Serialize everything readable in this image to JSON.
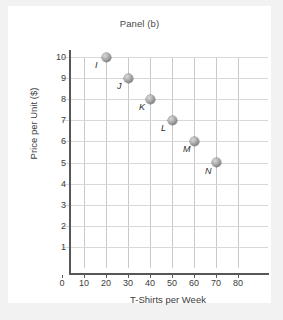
{
  "figure": {
    "title": "Panel (b)"
  },
  "chart_data": {
    "type": "scatter",
    "title": "Panel (b)",
    "xlabel": "T-Shirts per Week",
    "ylabel": "Price per Unit ($)",
    "xlim": [
      0,
      80
    ],
    "ylim": [
      0,
      10
    ],
    "xticks": [
      "0",
      "10",
      "20",
      "30",
      "40",
      "50",
      "60",
      "70",
      "80"
    ],
    "yticks": [
      "1",
      "2",
      "3",
      "4",
      "5",
      "6",
      "7",
      "8",
      "9",
      "10"
    ],
    "grid": true,
    "legend": "none",
    "marker_style": "gray-sphere",
    "points": [
      {
        "label": "I",
        "x": 20,
        "y": 10
      },
      {
        "label": "J",
        "x": 30,
        "y": 9
      },
      {
        "label": "K",
        "x": 40,
        "y": 8
      },
      {
        "label": "L",
        "x": 50,
        "y": 7
      },
      {
        "label": "M",
        "x": 60,
        "y": 6
      },
      {
        "label": "N",
        "x": 70,
        "y": 5
      }
    ]
  },
  "colors": {
    "page_background": "#f2f2f2",
    "card_background": "#ffffff",
    "axis": "#585858",
    "gridline_vertical": "#c9c9c9",
    "gridline_horizontal": "#d8d8d8",
    "text": "#3d3d3d",
    "marker": "#a9a9a9"
  }
}
